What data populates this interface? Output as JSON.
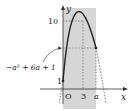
{
  "diagram": {
    "type": "function-graph",
    "axes": {
      "x_label": "x",
      "y_label": "y",
      "origin_label": "O"
    },
    "function": "-x^2+6x+1",
    "vertex": {
      "x": 3,
      "y": 10
    },
    "y_intercept": 1,
    "labels": {
      "y_max": "10",
      "y_intercept": "1",
      "x_vertex": "3",
      "x_a": "a",
      "value_at_a": "−a² + 6a + 1"
    },
    "colors": {
      "shade": "#d6d6d6",
      "curve": "#222222",
      "guide": "#555555"
    }
  }
}
